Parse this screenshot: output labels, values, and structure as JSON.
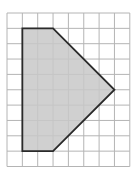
{
  "figure": {
    "grid": {
      "columns": 8,
      "rows": 10
    },
    "shape": {
      "name": "pentagon",
      "vertices": [
        [
          1,
          1
        ],
        [
          3,
          1
        ],
        [
          7,
          5
        ],
        [
          3,
          9
        ],
        [
          1,
          9
        ]
      ],
      "fill_color": "#c8c8c8",
      "stroke_color": "#2a2a2a"
    },
    "grid_line_color": "#b4b4b4"
  }
}
